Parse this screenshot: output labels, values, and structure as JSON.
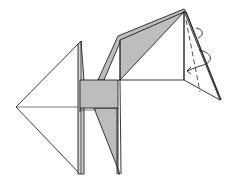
{
  "diagram": {
    "type": "origami-instruction",
    "colors": {
      "paper_front": "#ffffff",
      "paper_back": "#bdbdbd",
      "line": "#222222"
    },
    "annotations": {
      "fold_line": "dashed valley fold line on head",
      "arrow": "curved rotation arrow indicating wrap/turn of head flap"
    }
  }
}
